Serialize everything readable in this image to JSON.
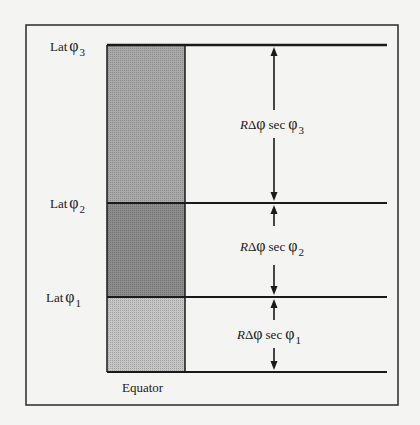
{
  "figure": {
    "colors": {
      "background": "#f4f4f2",
      "ink": "#1a1a1a",
      "shade_top": "#a9a9a9",
      "shade_middle": "#8c8c8c",
      "shade_bottom": "#c6c6c6"
    },
    "latitudes": [
      {
        "id": "lat3",
        "label": "Lat",
        "symbol": "φ",
        "subscript": "3"
      },
      {
        "id": "lat2",
        "label": "Lat",
        "symbol": "φ",
        "subscript": "2"
      },
      {
        "id": "lat1",
        "label": "Lat",
        "symbol": "φ",
        "subscript": "1"
      }
    ],
    "spacings": [
      {
        "id": "spacing3",
        "R": "R",
        "delta": "Δ",
        "phi": "φ",
        "sec": "sec",
        "phi2": "φ",
        "subscript": "3"
      },
      {
        "id": "spacing2",
        "R": "R",
        "delta": "Δ",
        "phi": "φ",
        "sec": "sec",
        "phi2": "φ",
        "subscript": "2"
      },
      {
        "id": "spacing1",
        "R": "R",
        "delta": "Δ",
        "phi": "φ",
        "sec": "sec",
        "phi2": "φ",
        "subscript": "1"
      }
    ],
    "equator_label": "Equator"
  }
}
